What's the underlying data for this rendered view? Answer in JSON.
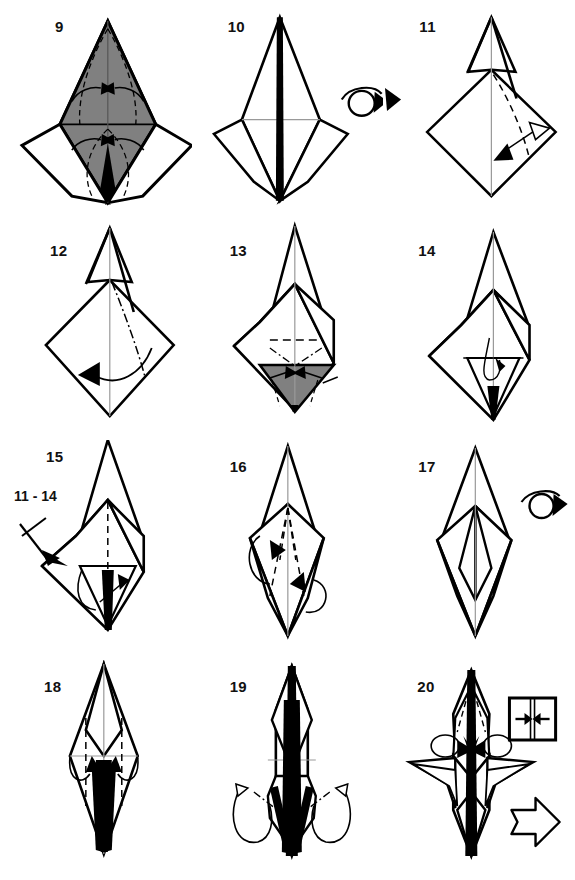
{
  "document": {
    "title": "Origami folding diagram steps 9-20",
    "type": "origami-instruction-sheet",
    "background_color": "#ffffff",
    "ink_color": "#000000",
    "shaded_paper_color": "#808080",
    "crease_color": "#9a9a9a",
    "columns": 3,
    "rows": 4
  },
  "panels": [
    {
      "number": "9",
      "num_x": 55,
      "num_y": 24,
      "shaded": true,
      "symbols": [
        "valley-fold-arrows",
        "dashed-crease-lines"
      ],
      "description": "Shaded kite-bird base with four solid fold arrows pointing inward toward the center line"
    },
    {
      "number": "10",
      "num_x": 228,
      "num_y": 24,
      "shaded": false,
      "symbols": [
        "turn-over-arrow"
      ],
      "description": "Narrow white bird base with thick center spine; turn-over loop arrow to the right"
    },
    {
      "number": "11",
      "num_x": 418,
      "num_y": 24,
      "shaded": false,
      "symbols": [
        "double-headed-arrow",
        "dashed-crease-line"
      ],
      "description": "Diamond with dashed crease and a double-headed hollow/solid arrow indicating fold and unfold"
    },
    {
      "number": "12",
      "num_x": 50,
      "num_y": 258,
      "shaded": false,
      "symbols": [
        "curved-fold-arrow",
        "dash-dot-crease-line"
      ],
      "description": "Diamond with dash-dot mountain crease and a long curved arrow sweeping to the left"
    },
    {
      "number": "13",
      "num_x": 228,
      "num_y": 258,
      "shaded": true,
      "symbols": [
        "dashed-crease-line",
        "dash-dot-crease-lines",
        "fold-arrows"
      ],
      "description": "Form with shaded lower triangle, dashed horizontal crease and two inward fold arrows"
    },
    {
      "number": "14",
      "num_x": 415,
      "num_y": 258,
      "shaded": false,
      "symbols": [
        "dash-dot-crease-line",
        "small-curved-arrow"
      ],
      "description": "Narrowed form with a dash-dot horizontal crease and small tuck arrow at the center"
    },
    {
      "number": "15",
      "num_x": 50,
      "num_y": 468,
      "shaded": false,
      "symbols": [
        "repeat-arrow-with-x",
        "curved-fold-arrow"
      ],
      "repeat_label": "11 - 14",
      "repeat_label_x": 8,
      "repeat_label_y": 505,
      "description": "Repeat steps 11 to 14 on the other side; crossed arrow marks the repeat"
    },
    {
      "number": "16",
      "num_x": 228,
      "num_y": 468,
      "shaded": false,
      "symbols": [
        "dashed-crease-lines",
        "two-loop-fold-arrows"
      ],
      "description": "Slim diamond with two dashed creases and two looping fold arrows"
    },
    {
      "number": "17",
      "num_x": 415,
      "num_y": 468,
      "shaded": false,
      "symbols": [
        "turn-over-arrow"
      ],
      "description": "Completed narrow form; turn the model over"
    },
    {
      "number": "18",
      "num_x": 50,
      "num_y": 680,
      "shaded": false,
      "symbols": [
        "dashed-crease-lines",
        "two-curved-fold-arrows"
      ],
      "description": "Tall slim shape with two vertical dashed creases and two curved arrows folding inward"
    },
    {
      "number": "19",
      "num_x": 228,
      "num_y": 680,
      "shaded": false,
      "symbols": [
        "dash-dot-crease-lines",
        "two-hollow-outside-reverse-arrows"
      ],
      "description": "Narrow shape with two dash-dot creases and large outside-reverse-fold hollow arrows"
    },
    {
      "number": "20",
      "num_x": 415,
      "num_y": 680,
      "shaded": false,
      "symbols": [
        "press-flat-box-symbol",
        "next-step-hollow-arrow",
        "loop-fold-arrows",
        "dashed-crease-lines"
      ],
      "description": "Insect-like figure with legs; boxed press-together symbol and a large hollow arrow to the next step"
    }
  ],
  "legend": {
    "press_symbol_name": "press-flat-symbol",
    "next_arrow_name": "next-step-arrow",
    "turn_over_name": "turn-over-symbol",
    "repeat_x_name": "repeat-cross-mark"
  }
}
